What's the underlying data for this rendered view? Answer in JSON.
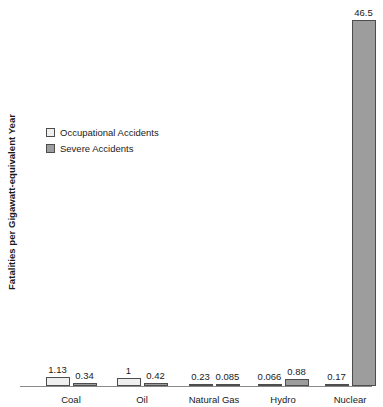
{
  "chart_data": {
    "type": "bar",
    "title": "",
    "xlabel": "",
    "ylabel": "Fatalities per Gigawatt-equivalent Year",
    "ylim": [
      0,
      50
    ],
    "grid": false,
    "legend_position": "upper-left",
    "categories": [
      "Coal",
      "Oil",
      "Natural Gas",
      "Hydro",
      "Nuclear"
    ],
    "series": [
      {
        "name": "Occupational Accidents",
        "color": "#efefef",
        "values": [
          1.13,
          1,
          0.23,
          0.066,
          0.17
        ],
        "labels": [
          "1.13",
          "1",
          "0.23",
          "0.066",
          "0.17"
        ]
      },
      {
        "name": "Severe Accidents",
        "color": "#9d9d9d",
        "values": [
          0.34,
          0.42,
          0.085,
          0.88,
          46.5
        ],
        "labels": [
          "0.34",
          "0.42",
          "0.085",
          "0.88",
          "46.5"
        ]
      }
    ]
  },
  "legend": {
    "items": [
      {
        "label": "Occupational Accidents",
        "swatch": "#efefef"
      },
      {
        "label": "Severe Accidents",
        "swatch": "#9d9d9d"
      }
    ]
  },
  "axis": {
    "y_title": "Fatalities per Gigawatt-equivalent Year"
  }
}
